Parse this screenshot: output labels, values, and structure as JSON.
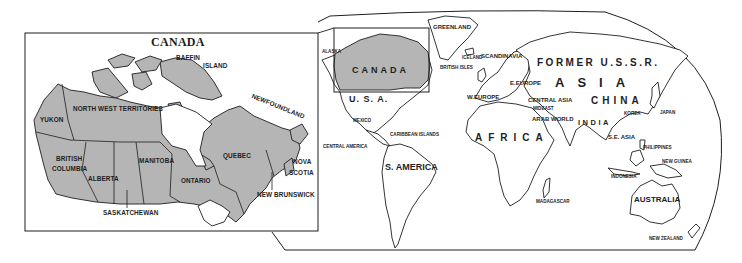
{
  "colors": {
    "background": "#ffffff",
    "land_highlight": "#b5b5b5",
    "outline": "#1e1e1e",
    "text": "#1e1e1e"
  },
  "inset": {
    "title": "CANADA",
    "labels": {
      "baffin": "BAFFIN",
      "island": "ISLAND",
      "newfoundland": "NEWFOUNDLAND",
      "yukon": "YUKON",
      "nwt": "NORTH  WEST  TERRITORIES",
      "british": "BRITISH",
      "columbia": "COLUMBIA",
      "alberta": "ALBERTA",
      "manitoba": "MANITOBA",
      "ontario": "ONTARIO",
      "quebec": "QUEBEC",
      "nova": "NOVA",
      "scotia": "SCOTIA",
      "new_brunswick": "NEW  BRUNSWICK",
      "saskatchewan": "SASKATCHEWAN"
    }
  },
  "world": {
    "labels": {
      "alaska": "ALASKA",
      "greenland": "GREENLAND",
      "canada": "CANADA",
      "usa": "U. S. A.",
      "iceland": "ICELAND",
      "scandinavia": "SCANDINAVIA",
      "british_isles": "BRITISH ISLES",
      "former_ussr": "FORMER U.S.S.R.",
      "e_europe": "E.EUROPE",
      "w_europe": "W.EUROPE",
      "asia": "ASIA",
      "central_asia": "CENTRAL ASIA",
      "china": "CHINA",
      "mideast": "MIDEAST",
      "arab_world": "ARAB WORLD",
      "india": "INDIA",
      "korea": "KOREA",
      "japan": "JAPAN",
      "mexico": "MEXICO",
      "caribbean": "CARIBBEAN ISLANDS",
      "central_america": "CENTRAL AMERICA",
      "africa": "AFRICA",
      "s_america": "S. AMERICA",
      "se_asia": "S.E. ASIA",
      "philippines": "PHILIPPINES",
      "new_guinea": "NEW GUINEA",
      "indonesia": "INDONESIA",
      "madagascar": "MADAGASCAR",
      "australia": "AUSTRALIA",
      "new_zealand": "NEW ZEALAND"
    }
  }
}
